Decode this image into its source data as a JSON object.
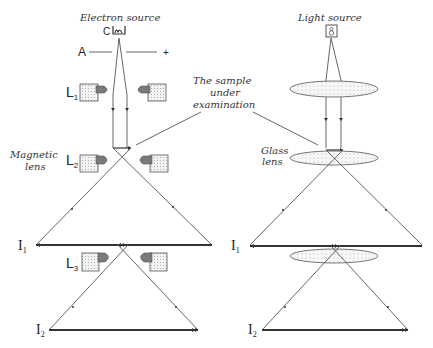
{
  "left_panel": {
    "title": "Electron source",
    "cathode_label": "C",
    "anode_label": "A",
    "anode_plus": "+",
    "lens_labels": [
      "L",
      "L",
      "L"
    ],
    "lens_subscripts": [
      "1",
      "2",
      "3"
    ],
    "side_label_line1": "Magnetic",
    "side_label_line2": "lens",
    "image_labels": [
      "I",
      "I"
    ],
    "image_subscripts": [
      "1",
      "2"
    ]
  },
  "right_panel": {
    "title": "Light source",
    "side_label_line1": "Glass",
    "side_label_line2": "lens",
    "image_labels": [
      "I",
      "I"
    ],
    "image_subscripts": [
      "1",
      "2"
    ]
  },
  "center_callout": {
    "line1": "The sample",
    "line2": "under",
    "line3": "examination"
  },
  "colors": {
    "ray": "#666666",
    "coil_fill": "#d8d8d8",
    "pole_fill": "#7a7a7a",
    "lens_fill": "#eeeeee",
    "text": "#333333"
  }
}
